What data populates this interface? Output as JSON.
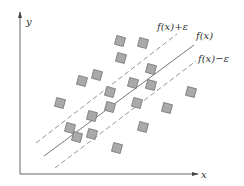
{
  "diagram": {
    "axes": {
      "x_label": "x",
      "y_label": "y",
      "color": "#555555",
      "origin": [
        20,
        174
      ],
      "x_end": [
        198,
        174
      ],
      "y_end": [
        20,
        12
      ]
    },
    "lines": [
      {
        "id": "upper",
        "label": "f(x)+ε",
        "style": "dashed",
        "from": [
          36,
          143
        ],
        "to": [
          177,
          34
        ],
        "label_pos": [
          157,
          30
        ]
      },
      {
        "id": "center",
        "label": "f(x)",
        "style": "solid",
        "from": [
          44,
          156
        ],
        "to": [
          194,
          45
        ],
        "label_pos": [
          196,
          39
        ]
      },
      {
        "id": "lower",
        "label": "f(x)−ε",
        "style": "dashed",
        "from": [
          55,
          168
        ],
        "to": [
          196,
          61
        ],
        "label_pos": [
          198,
          62
        ]
      }
    ],
    "point_style": {
      "fill": "#a9a9a9",
      "stroke": "#7a7a7a",
      "size": 9,
      "rotation": 15
    },
    "points": [
      [
        120,
        41
      ],
      [
        143,
        43
      ],
      [
        121,
        58
      ],
      [
        97,
        75
      ],
      [
        82,
        81
      ],
      [
        133,
        83
      ],
      [
        151,
        69
      ],
      [
        110,
        92
      ],
      [
        151,
        85
      ],
      [
        137,
        103
      ],
      [
        167,
        108
      ],
      [
        191,
        92
      ],
      [
        60,
        103
      ],
      [
        92,
        116
      ],
      [
        110,
        107
      ],
      [
        70,
        128
      ],
      [
        77,
        137
      ],
      [
        92,
        134
      ],
      [
        117,
        148
      ],
      [
        143,
        127
      ]
    ]
  }
}
